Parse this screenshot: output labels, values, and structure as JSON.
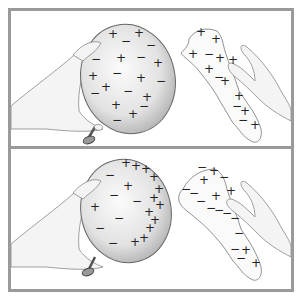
{
  "figure": {
    "panels": [
      {
        "id": "before",
        "balloon": {
          "charges": [
            {
              "s": "+",
              "x": 102,
              "y": 27
            },
            {
              "s": "−",
              "x": 115,
              "y": 34
            },
            {
              "s": "+",
              "x": 128,
              "y": 26
            },
            {
              "s": "−",
              "x": 140,
              "y": 38
            },
            {
              "s": "−",
              "x": 85,
              "y": 52
            },
            {
              "s": "+",
              "x": 110,
              "y": 51
            },
            {
              "s": "−",
              "x": 130,
              "y": 50
            },
            {
              "s": "+",
              "x": 147,
              "y": 56
            },
            {
              "s": "+",
              "x": 82,
              "y": 69
            },
            {
              "s": "−",
              "x": 106,
              "y": 66
            },
            {
              "s": "+",
              "x": 130,
              "y": 71
            },
            {
              "s": "−",
              "x": 150,
              "y": 74
            },
            {
              "s": "+",
              "x": 95,
              "y": 80
            },
            {
              "s": "−",
              "x": 84,
              "y": 86
            },
            {
              "s": "−",
              "x": 117,
              "y": 84
            },
            {
              "s": "+",
              "x": 136,
              "y": 90
            },
            {
              "s": "+",
              "x": 105,
              "y": 98
            },
            {
              "s": "−",
              "x": 133,
              "y": 99
            },
            {
              "s": "+",
              "x": 122,
              "y": 107
            },
            {
              "s": "−",
              "x": 106,
              "y": 113
            }
          ]
        },
        "cloth": {
          "charges": [
            {
              "s": "+",
              "x": 190,
              "y": 25
            },
            {
              "s": "+",
              "x": 205,
              "y": 32
            },
            {
              "s": "+",
              "x": 182,
              "y": 47
            },
            {
              "s": "−",
              "x": 198,
              "y": 47
            },
            {
              "s": "+",
              "x": 209,
              "y": 51
            },
            {
              "s": "+",
              "x": 222,
              "y": 53
            },
            {
              "s": "+",
              "x": 198,
              "y": 62
            },
            {
              "s": "−",
              "x": 208,
              "y": 70
            },
            {
              "s": "+",
              "x": 214,
              "y": 74
            },
            {
              "s": "+",
              "x": 228,
              "y": 89
            },
            {
              "s": "−",
              "x": 226,
              "y": 99
            },
            {
              "s": "+",
              "x": 234,
              "y": 104
            },
            {
              "s": "−",
              "x": 232,
              "y": 113
            },
            {
              "s": "+",
              "x": 244,
              "y": 118
            }
          ]
        }
      },
      {
        "id": "after",
        "balloon": {
          "charges": [
            {
              "s": "+",
              "x": 115,
              "y": 18
            },
            {
              "s": "+",
              "x": 125,
              "y": 21
            },
            {
              "s": "+",
              "x": 135,
              "y": 24
            },
            {
              "s": "+",
              "x": 143,
              "y": 32
            },
            {
              "s": "−",
              "x": 99,
              "y": 30
            },
            {
              "s": "+",
              "x": 117,
              "y": 41
            },
            {
              "s": "+",
              "x": 148,
              "y": 44
            },
            {
              "s": "+",
              "x": 143,
              "y": 53
            },
            {
              "s": "−",
              "x": 103,
              "y": 50
            },
            {
              "s": "−",
              "x": 126,
              "y": 56
            },
            {
              "s": "+",
              "x": 149,
              "y": 60
            },
            {
              "s": "+",
              "x": 84,
              "y": 62
            },
            {
              "s": "+",
              "x": 138,
              "y": 67
            },
            {
              "s": "+",
              "x": 144,
              "y": 75
            },
            {
              "s": "−",
              "x": 108,
              "y": 73
            },
            {
              "s": "−",
              "x": 89,
              "y": 83
            },
            {
              "s": "+",
              "x": 139,
              "y": 83
            },
            {
              "s": "+",
              "x": 133,
              "y": 93
            },
            {
              "s": "−",
              "x": 102,
              "y": 98
            },
            {
              "s": "+",
              "x": 124,
              "y": 97
            }
          ]
        },
        "cloth": {
          "charges": [
            {
              "s": "−",
              "x": 191,
              "y": 22
            },
            {
              "s": "+",
              "x": 203,
              "y": 26
            },
            {
              "s": "+",
              "x": 193,
              "y": 35
            },
            {
              "s": "−",
              "x": 213,
              "y": 32
            },
            {
              "s": "+",
              "x": 220,
              "y": 46
            },
            {
              "s": "+",
              "x": 205,
              "y": 51
            },
            {
              "s": "−",
              "x": 175,
              "y": 44
            },
            {
              "s": "−",
              "x": 183,
              "y": 48
            },
            {
              "s": "−",
              "x": 190,
              "y": 56
            },
            {
              "s": "−",
              "x": 200,
              "y": 63
            },
            {
              "s": "−",
              "x": 208,
              "y": 65
            },
            {
              "s": "−",
              "x": 216,
              "y": 68
            },
            {
              "s": "−",
              "x": 224,
              "y": 73
            },
            {
              "s": "−",
              "x": 228,
              "y": 88
            },
            {
              "s": "+",
              "x": 235,
              "y": 105
            },
            {
              "s": "−",
              "x": 224,
              "y": 104
            },
            {
              "s": "−",
              "x": 230,
              "y": 113
            },
            {
              "s": "+",
              "x": 245,
              "y": 118
            }
          ]
        }
      }
    ],
    "colors": {
      "frame": "#9a9a9a",
      "balloon_fill": "#d9d9d9",
      "outline": "#6a6a6a",
      "skin": "#f2f2f2",
      "ink": "#222222"
    }
  }
}
